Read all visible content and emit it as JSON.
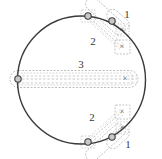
{
  "figure": {
    "width": 162,
    "height": 159,
    "background_color": "#ffffff"
  },
  "colors": {
    "circle_stroke": "#3a3a3a",
    "enclosure_stroke": "#9a9a9a",
    "connector_stroke": "#b0b0b0",
    "marker_circle_stroke": "#3f3f3f",
    "marker_circle_fill": "#c8c8c8",
    "label_color": "#3a3a3a",
    "x_color": "#4a4a4a"
  },
  "main_circle": {
    "name": "boundary-circle",
    "center_x": 81.5,
    "center_y": 80,
    "radius": 64,
    "stroke_width": 1.4
  },
  "groups": [
    {
      "id": "group-top-1",
      "label": "1",
      "label_x": 127,
      "label_y": 15,
      "region": "top",
      "circle_marker": {
        "x": 112,
        "y": 21
      },
      "x_marker": {
        "x": 122,
        "y": 30
      },
      "enclosure": {
        "x": 104,
        "y": 14,
        "width": 26,
        "height": 23,
        "rotation": -20
      }
    },
    {
      "id": "group-top-2",
      "label": "2",
      "label_x": 93,
      "label_y": 42,
      "region": "top",
      "circle_marker": {
        "x": 88,
        "y": 16
      },
      "x_marker": {
        "x": 122,
        "y": 47
      },
      "enclosure": {
        "x": 82,
        "y": 10,
        "width": 47,
        "height": 41,
        "rotation": -36
      }
    },
    {
      "id": "group-middle-3",
      "label": "3",
      "label_x": 81,
      "label_y": 65,
      "region": "middle",
      "circle_marker": {
        "x": 18,
        "y": 79
      },
      "x_marker": {
        "x": 125,
        "y": 79
      },
      "enclosure": {
        "x": 10,
        "y": 71,
        "width": 135,
        "height": 17,
        "rotation": 0
      }
    },
    {
      "id": "group-bottom-2",
      "label": "2",
      "label_x": 92,
      "label_y": 118,
      "region": "bottom",
      "circle_marker": {
        "x": 88,
        "y": 142
      },
      "x_marker": {
        "x": 122,
        "y": 112
      },
      "enclosure": {
        "x": 82,
        "y": 108,
        "width": 47,
        "height": 41,
        "rotation": 36
      }
    },
    {
      "id": "group-bottom-1",
      "label": "1",
      "label_x": 128,
      "label_y": 145,
      "region": "bottom",
      "circle_marker": {
        "x": 112,
        "y": 137
      },
      "x_marker": {
        "x": 122,
        "y": 128
      },
      "enclosure": {
        "x": 104,
        "y": 122,
        "width": 26,
        "height": 23,
        "rotation": 20
      }
    }
  ],
  "markers": {
    "circle_symbol_name": "circle-point-marker",
    "x_symbol_name": "x-point-marker",
    "x_glyph": "×",
    "circle_radius": 3.2
  },
  "labels": [
    "1",
    "2",
    "3",
    "2",
    "1"
  ]
}
